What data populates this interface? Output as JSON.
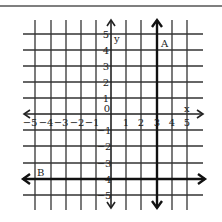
{
  "figure": {
    "type": "coordinate-plane",
    "x_axis_label": "x",
    "y_axis_label": "y",
    "x_ticks": [
      "-5",
      "-4",
      "-3",
      "-2",
      "-1",
      "1",
      "2",
      "3",
      "4",
      "5"
    ],
    "y_ticks": [
      "5",
      "4",
      "3",
      "2",
      "1",
      "-1",
      "-2",
      "-3",
      "-4",
      "-5"
    ],
    "origin_label": "0",
    "x_range": [
      -5,
      5
    ],
    "y_range": [
      -5,
      5
    ],
    "lines": [
      {
        "label": "A",
        "orientation": "vertical",
        "equation": "x = 3"
      },
      {
        "label": "B",
        "orientation": "horizontal",
        "equation": "y = -4"
      }
    ],
    "colors": {
      "ink": "#222222",
      "grid": "#333333",
      "background": "#ffffff"
    }
  }
}
